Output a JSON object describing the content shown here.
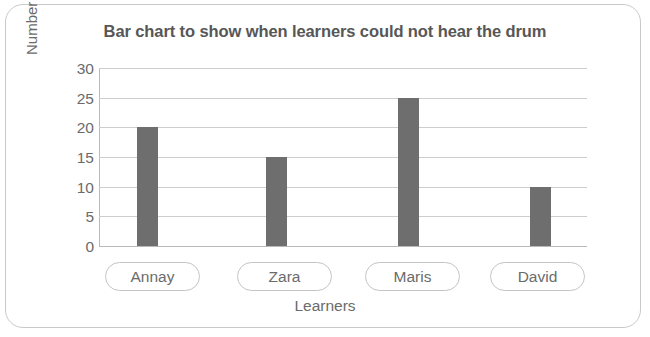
{
  "chart_data": {
    "type": "bar",
    "title": "Bar chart to show when learners could not hear the drum",
    "xlabel": "Learners",
    "ylabel": "Number of steps",
    "categories": [
      "Annay",
      "Zara",
      "Maris",
      "David"
    ],
    "values": [
      20,
      15,
      25,
      10
    ],
    "ylim": [
      0,
      30
    ],
    "ytick_step": 5,
    "yticks": [
      0,
      5,
      10,
      15,
      20,
      25,
      30
    ],
    "ytick_labels": [
      "0",
      "5",
      "10",
      "15",
      "20",
      "25",
      "30"
    ],
    "grid": "horizontal",
    "legend": "none",
    "series": [
      {
        "name": "Number of steps",
        "values": [
          20,
          15,
          25,
          10
        ],
        "color": "#6e6e6e"
      }
    ],
    "colors": {
      "bar": "#6e6e6e",
      "grid": "#cdcdcd",
      "axis": "#b9b9b9",
      "title_text": "#575757",
      "label_text": "#6b6b6b",
      "frame_border": "#c9c9c9",
      "background": "#ffffff"
    }
  }
}
